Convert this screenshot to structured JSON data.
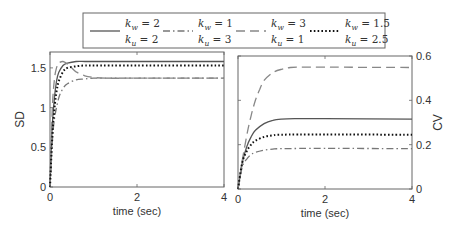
{
  "chart_data": [
    {
      "type": "line",
      "title": "",
      "xlabel": "time (sec)",
      "ylabel": "SD",
      "xlim": [
        0,
        4
      ],
      "ylim": [
        0,
        1.7
      ],
      "xticks": [
        0,
        2,
        4
      ],
      "yticks": [
        0,
        0.5,
        1,
        1.5
      ],
      "ytick_labels": [
        "0",
        "0.5",
        "1",
        "1.5"
      ],
      "yaxis_side": "left",
      "grid": false,
      "series": [
        {
          "name": "k_w = 2, k_u = 2",
          "style": "solid",
          "x": [
            0,
            0.05,
            0.1,
            0.15,
            0.2,
            0.3,
            0.4,
            0.6,
            0.8,
            1.0,
            2.0,
            4.0
          ],
          "values": [
            0,
            0.75,
            1.12,
            1.33,
            1.44,
            1.53,
            1.56,
            1.58,
            1.58,
            1.58,
            1.58,
            1.58
          ]
        },
        {
          "name": "k_w = 1, k_u = 3",
          "style": "dashdot",
          "x": [
            0,
            0.05,
            0.1,
            0.2,
            0.3,
            0.4,
            0.6,
            0.8,
            1.0,
            1.5,
            2.0,
            4.0
          ],
          "values": [
            0,
            0.55,
            0.85,
            1.12,
            1.24,
            1.3,
            1.35,
            1.36,
            1.37,
            1.37,
            1.37,
            1.37
          ]
        },
        {
          "name": "k_w = 3, k_u = 1",
          "style": "dashed",
          "x": [
            0,
            0.05,
            0.1,
            0.15,
            0.2,
            0.3,
            0.4,
            0.5,
            0.6,
            0.8,
            1.0,
            1.3,
            2.0,
            4.0
          ],
          "values": [
            0,
            0.95,
            1.35,
            1.5,
            1.56,
            1.58,
            1.55,
            1.5,
            1.45,
            1.4,
            1.38,
            1.37,
            1.37,
            1.37
          ]
        },
        {
          "name": "k_w = 1.5, k_u = 2.5",
          "style": "dotted",
          "x": [
            0,
            0.05,
            0.1,
            0.15,
            0.2,
            0.3,
            0.4,
            0.6,
            0.8,
            1.0,
            2.0,
            4.0
          ],
          "values": [
            0,
            0.6,
            0.98,
            1.2,
            1.33,
            1.45,
            1.5,
            1.52,
            1.53,
            1.53,
            1.53,
            1.53
          ]
        }
      ]
    },
    {
      "type": "line",
      "title": "",
      "xlabel": "time (sec)",
      "ylabel": "CV",
      "xlim": [
        0,
        4
      ],
      "ylim": [
        0,
        0.6
      ],
      "xticks": [
        0,
        2,
        4
      ],
      "yticks": [
        0,
        0.2,
        0.4,
        0.6
      ],
      "ytick_labels": [
        "0",
        "0.2",
        "0.4",
        "0.6"
      ],
      "yaxis_side": "right",
      "grid": false,
      "series": [
        {
          "name": "k_w = 2, k_u = 2",
          "style": "solid",
          "x": [
            0,
            0.1,
            0.2,
            0.3,
            0.4,
            0.6,
            0.8,
            1.0,
            1.3,
            2.0,
            4.0
          ],
          "values": [
            0,
            0.12,
            0.19,
            0.235,
            0.265,
            0.295,
            0.31,
            0.315,
            0.317,
            0.317,
            0.315
          ]
        },
        {
          "name": "k_w = 1, k_u = 3",
          "style": "dashdot",
          "x": [
            0,
            0.1,
            0.2,
            0.3,
            0.4,
            0.6,
            0.8,
            1.0,
            2.0,
            4.0
          ],
          "values": [
            0,
            0.1,
            0.135,
            0.155,
            0.165,
            0.175,
            0.18,
            0.182,
            0.183,
            0.182
          ]
        },
        {
          "name": "k_w = 3, k_u = 1",
          "style": "dashed",
          "x": [
            0,
            0.1,
            0.2,
            0.3,
            0.4,
            0.5,
            0.6,
            0.8,
            1.0,
            1.2,
            1.5,
            2.0,
            4.0
          ],
          "values": [
            0,
            0.13,
            0.24,
            0.33,
            0.4,
            0.45,
            0.49,
            0.525,
            0.54,
            0.548,
            0.55,
            0.55,
            0.548
          ]
        },
        {
          "name": "k_w = 1.5, k_u = 2.5",
          "style": "dotted",
          "x": [
            0,
            0.1,
            0.2,
            0.3,
            0.4,
            0.6,
            0.8,
            1.0,
            2.0,
            4.0
          ],
          "values": [
            0,
            0.12,
            0.17,
            0.2,
            0.218,
            0.235,
            0.242,
            0.245,
            0.246,
            0.245
          ]
        }
      ]
    }
  ],
  "legend": {
    "entries": [
      {
        "style": "solid",
        "line1": "k_w = 2",
        "line2": "k_u = 2"
      },
      {
        "style": "dashdot",
        "line1": "k_w = 1",
        "line2": "k_u = 3"
      },
      {
        "style": "dashed",
        "line1": "k_w = 3",
        "line2": "k_u = 1"
      },
      {
        "style": "dotted",
        "line1": "k_w = 1.5",
        "line2": "k_u = 2.5"
      }
    ]
  },
  "colors": {
    "solid": "#555555",
    "dashdot": "#777777",
    "dashed": "#888888",
    "dotted": "#111111",
    "axis": "#666666",
    "text": "#333333"
  }
}
